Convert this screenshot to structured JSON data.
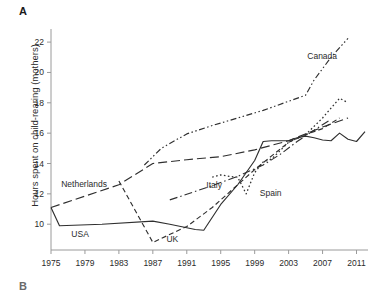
{
  "figure": {
    "panel_label": "A",
    "panel_label_next": "B"
  },
  "chart_data": {
    "type": "line",
    "title": "",
    "subtitle": "",
    "xlabel": "",
    "ylabel": "Hours spent on child-rearing (mothers)",
    "xlim": [
      1975,
      2012
    ],
    "ylim": [
      8.3,
      22.6
    ],
    "xticks": [
      1975,
      1979,
      1983,
      1987,
      1991,
      1995,
      1999,
      2003,
      2007,
      2011
    ],
    "xtick_labels": [
      "1975",
      "1979",
      "1983",
      "1987",
      "1991",
      "1995",
      "1999",
      "2003",
      "2007",
      "2011"
    ],
    "yticks": [
      10,
      12,
      14,
      16,
      18,
      20,
      22
    ],
    "ytick_labels": [
      "10",
      "12",
      "14",
      "16",
      "18",
      "20",
      "22"
    ],
    "grid": false,
    "legend_position": "inline-annotations",
    "series": [
      {
        "name": "USA",
        "style": "solid",
        "label_x": 1977.4,
        "label_y": 9.15,
        "x": [
          1975,
          1976,
          1981,
          1987,
          1989,
          1992,
          1993,
          1995,
          1997,
          1999,
          2000,
          2001,
          2003,
          2004,
          2005,
          2006,
          2007,
          2008,
          2009,
          2010,
          2011,
          2012
        ],
        "y": [
          11.1,
          9.9,
          10.0,
          10.2,
          10.0,
          9.65,
          9.6,
          11.3,
          12.6,
          14.2,
          15.45,
          15.5,
          15.5,
          15.7,
          15.8,
          15.7,
          15.55,
          15.5,
          16.0,
          15.6,
          15.45,
          16.1
        ]
      },
      {
        "name": "Netherlands",
        "style": "long-dash",
        "label_x": 1976.2,
        "label_y": 12.45,
        "x": [
          1975,
          1983,
          1987,
          1991,
          1995,
          1999,
          2003,
          2007,
          2010
        ],
        "y": [
          11.1,
          12.6,
          14.0,
          14.25,
          14.45,
          14.9,
          15.5,
          16.4,
          17.0
        ]
      },
      {
        "name": "UK",
        "style": "dash",
        "label_x": 1988.6,
        "label_y": 8.85,
        "x": [
          1983,
          1987,
          1991,
          1994,
          1997,
          1999,
          2001,
          2003,
          2005,
          2007,
          2009
        ],
        "y": [
          12.85,
          8.8,
          9.85,
          11.1,
          12.6,
          13.6,
          14.5,
          15.4,
          15.9,
          16.3,
          17.0
        ]
      },
      {
        "name": "Italy",
        "style": "dash-dot",
        "label_x": 1993.3,
        "label_y": 12.4,
        "x": [
          1989,
          1993,
          1997,
          2000,
          2002,
          2004,
          2006,
          2008
        ],
        "y": [
          11.6,
          12.35,
          13.15,
          13.9,
          14.6,
          15.45,
          16.2,
          16.9
        ]
      },
      {
        "name": "Spain",
        "style": "dot",
        "label_x": 1999.6,
        "label_y": 11.85,
        "x": [
          1994,
          1995,
          1996,
          1997,
          1998,
          1999,
          2000,
          2001,
          2003,
          2005,
          2007,
          2009,
          2010
        ],
        "y": [
          13.1,
          13.25,
          13.15,
          13.1,
          12.0,
          13.4,
          14.1,
          14.3,
          15.4,
          15.9,
          17.0,
          18.3,
          18.0
        ]
      },
      {
        "name": "Canada",
        "style": "dash-dot-dot",
        "label_x": 2005.2,
        "label_y": 20.9,
        "x": [
          1986,
          1988,
          1991,
          1994,
          1997,
          2000,
          2003,
          2005,
          2006,
          2008,
          2010
        ],
        "y": [
          13.9,
          15.0,
          15.95,
          16.5,
          17.0,
          17.5,
          18.1,
          18.5,
          19.5,
          21.0,
          22.25
        ]
      }
    ]
  }
}
